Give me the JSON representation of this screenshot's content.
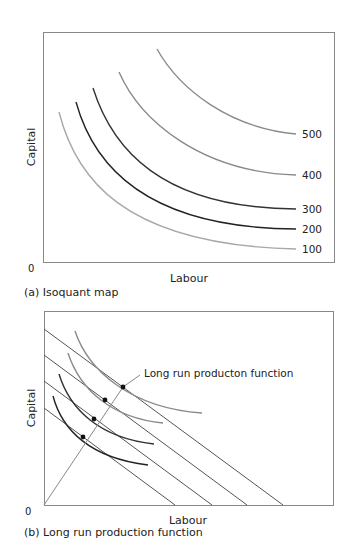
{
  "panel_a": {
    "caption": "(a) Isoquant map",
    "xlabel": "Labour",
    "ylabel": "Capital",
    "origin": "0",
    "isoquants": [
      {
        "label": "100",
        "color": "#a8a8a8",
        "path": "M59,112 C75,175 120,245 296,249",
        "lx": 302,
        "ly": 249
      },
      {
        "label": "200",
        "color": "#222222",
        "path": "M76,102 C92,160 140,228 296,229",
        "lx": 302,
        "ly": 229
      },
      {
        "label": "300",
        "color": "#333333",
        "path": "M93,88 C112,148 160,208 296,209",
        "lx": 302,
        "ly": 209
      },
      {
        "label": "400",
        "color": "#8a8a8a",
        "path": "M119,72 C140,120 200,172 296,175",
        "lx": 302,
        "ly": 175
      },
      {
        "label": "500",
        "color": "#8a8a8a",
        "path": "M157,49 C180,90 230,128 296,134",
        "lx": 302,
        "ly": 134
      }
    ]
  },
  "panel_b": {
    "caption": "(b) Long run production function",
    "xlabel": "Labour",
    "ylabel": "Capital",
    "origin": "0",
    "annotation": "Long run producton function",
    "budget_lines": [
      {
        "x1": 44,
        "y1": 408,
        "x2": 175,
        "y2": 505
      },
      {
        "x1": 44,
        "y1": 381,
        "x2": 212,
        "y2": 505
      },
      {
        "x1": 44,
        "y1": 355,
        "x2": 247,
        "y2": 505
      },
      {
        "x1": 44,
        "y1": 329,
        "x2": 283,
        "y2": 505
      }
    ],
    "isoquants": [
      {
        "color": "#222222",
        "path": "M53,396 C62,430 90,458 148,465"
      },
      {
        "color": "#333333",
        "path": "M59,374 C70,410 100,438 154,444"
      },
      {
        "color": "#8a8a8a",
        "path": "M68,353 C80,390 112,418 163,423"
      },
      {
        "color": "#8a8a8a",
        "path": "M75,331 C88,370 130,408 202,413"
      }
    ],
    "tangency_points": [
      {
        "x": 83,
        "y": 437
      },
      {
        "x": 94,
        "y": 419
      },
      {
        "x": 105,
        "y": 400
      },
      {
        "x": 123,
        "y": 387
      }
    ]
  },
  "chart_data": [
    {
      "type": "line",
      "title": "(a) Isoquant map",
      "xlabel": "Labour",
      "ylabel": "Capital",
      "series": [
        {
          "name": "100"
        },
        {
          "name": "200"
        },
        {
          "name": "300"
        },
        {
          "name": "400"
        },
        {
          "name": "500"
        }
      ],
      "grid": false
    },
    {
      "type": "line",
      "title": "(b) Long run production function",
      "xlabel": "Labour",
      "ylabel": "Capital",
      "annotations": [
        "Long run producton function"
      ],
      "grid": false
    }
  ]
}
